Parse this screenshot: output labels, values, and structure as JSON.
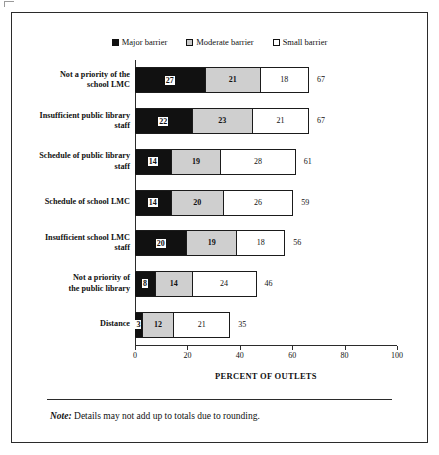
{
  "figure": {
    "note_label": "Note:",
    "note_text": "Details may not add up to totals due to rounding."
  },
  "chart_data": {
    "type": "bar",
    "orientation": "horizontal",
    "stacked": true,
    "title": "",
    "xlabel": "PERCENT OF OUTLETS",
    "ylabel": "",
    "xlim": [
      0,
      100
    ],
    "xticks": [
      0,
      20,
      40,
      60,
      80,
      100
    ],
    "grid": false,
    "legend_position": "top-center",
    "legend": [
      "Major barrier",
      "Moderate barrier",
      "Small barrier"
    ],
    "categories": [
      "Not a priority of the school LMC",
      "Insufficient public library staff",
      "Schedule of public library staff",
      "Schedule of school LMC",
      "Insufficient school LMC staff",
      "Not a priority of the public library",
      "Distance"
    ],
    "category_lines": [
      [
        "Not a priority of the",
        "school LMC"
      ],
      [
        "Insufficient public library",
        "staff"
      ],
      [
        "Schedule of public library",
        "staff"
      ],
      [
        "Schedule of school LMC"
      ],
      [
        "Insufficient school LMC",
        "staff"
      ],
      [
        "Not a priority of",
        "the public library"
      ],
      [
        "Distance"
      ]
    ],
    "series": [
      {
        "name": "Major barrier",
        "values": [
          27,
          22,
          14,
          14,
          20,
          8,
          3
        ]
      },
      {
        "name": "Moderate barrier",
        "values": [
          21,
          23,
          19,
          20,
          19,
          14,
          12
        ]
      },
      {
        "name": "Small barrier",
        "values": [
          18,
          21,
          28,
          26,
          18,
          24,
          21
        ]
      }
    ],
    "totals": [
      67,
      67,
      61,
      59,
      56,
      46,
      35
    ]
  },
  "colors": {
    "major": "#111111",
    "moderate": "#cfcfcf",
    "small": "#ffffff",
    "outline": "#1b1b1b",
    "frame": "#2b2b2b"
  }
}
